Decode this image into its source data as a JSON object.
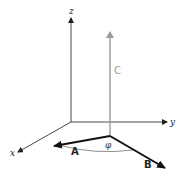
{
  "diagram": {
    "type": "3d-vector-diagram",
    "axes": [
      {
        "name": "x",
        "label": "x"
      },
      {
        "name": "y",
        "label": "y"
      },
      {
        "name": "z",
        "label": "z"
      }
    ],
    "vectors": [
      {
        "name": "A",
        "label": "A",
        "color": "#111111"
      },
      {
        "name": "B",
        "label": "B",
        "color": "#111111"
      },
      {
        "name": "C",
        "label": "C",
        "color": "#9a9a9a"
      }
    ],
    "angle": {
      "label": "φ",
      "between": [
        "A",
        "B"
      ]
    }
  }
}
